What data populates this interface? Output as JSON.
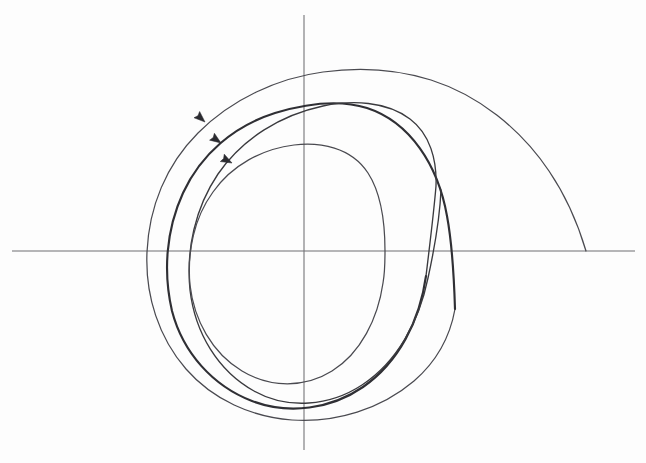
{
  "figure": {
    "title": "Spiral phase portrait with limit cycle",
    "background_color": "#fdfdfd",
    "ink_color": "#3a3a3e",
    "axis_color": "#6e6e72",
    "caption": ""
  },
  "axes": {
    "origin": {
      "x": 304,
      "y": 251
    },
    "x_axis": {
      "name": "horizontal-axis",
      "x_start": 12,
      "x_end": 635,
      "y": 251,
      "label": ""
    },
    "y_axis": {
      "name": "vertical-axis",
      "y_start": 15,
      "y_end": 450,
      "x": 304,
      "label": ""
    }
  },
  "chart_data": {
    "type": "line",
    "title": "Spiral phase portrait with limit cycle",
    "xlabel": "",
    "ylabel": "",
    "grid": false,
    "legend": "none",
    "xlim": [
      12,
      635
    ],
    "ylim": [
      15,
      450
    ],
    "origin": [
      304,
      251
    ],
    "series": [
      {
        "name": "outer-trajectory",
        "role": "incoming spiral from the right, winding counterclockwise inward",
        "stroke_width": 1.25,
        "description": "Enters the x-axis at the right and spirals inward toward the limit cycle",
        "entry_point": [
          586,
          251
        ],
        "top_apex_y": 72,
        "left_crossing_x": 147,
        "bottom_apex_y": 400
      },
      {
        "name": "limit-cycle",
        "role": "attracting closed orbit drawn with heavier ink",
        "stroke_width": 2.15,
        "description": "Thick nearly-closed loop the trajectory converges onto",
        "top_apex_y": 105,
        "left_crossing_x": 160,
        "right_crossing_x": 441,
        "bottom_apex_y": 392
      },
      {
        "name": "inner-trajectory",
        "role": "outward spiral from inside approaching the limit cycle",
        "stroke_width": 1.35,
        "description": "Third nested strand sharing the bottom and right arcs",
        "left_crossing_x": 178,
        "bottom_apex_y": 382
      },
      {
        "name": "inner-orbit",
        "role": "small inner circular orbit terminating on the positive x-axis",
        "stroke_width": 1.25,
        "top_apex_y": 145,
        "left_crossing_x": 186,
        "termination_point": [
          385,
          251
        ]
      }
    ],
    "direction_markers": [
      {
        "name": "arrow-outer",
        "x": 205,
        "y": 122,
        "angle_deg": 222,
        "meaning": "counterclockwise"
      },
      {
        "name": "arrow-limit-cycle",
        "x": 221,
        "y": 143,
        "angle_deg": 215,
        "meaning": "counterclockwise"
      },
      {
        "name": "arrow-inner",
        "x": 232,
        "y": 163,
        "angle_deg": 208,
        "meaning": "counterclockwise"
      }
    ]
  },
  "annotations": {
    "arrow_direction_note": "counterclockwise",
    "labels": []
  }
}
